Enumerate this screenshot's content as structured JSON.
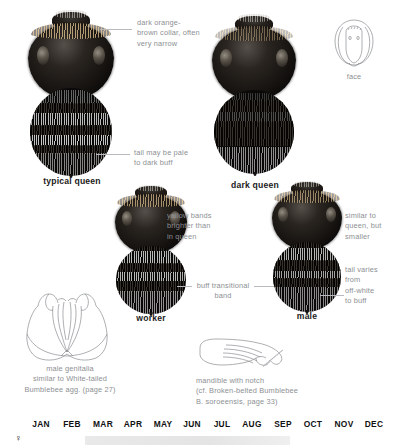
{
  "plate": {
    "species_common": "Buff-tailed Bumblebee",
    "figures": [
      {
        "id": "typical-queen",
        "caption": "typical queen"
      },
      {
        "id": "dark-queen",
        "caption": "dark queen"
      },
      {
        "id": "worker",
        "caption": "worker"
      },
      {
        "id": "male",
        "caption": "male"
      }
    ],
    "annotations": {
      "collar": "dark orange-\nbrown collar, often\nvery narrow",
      "tail": "tail may be pale\nto dark buff",
      "yellow_bands": "yellow bands\nbrighter than\nin queen",
      "buff_band": "buff transitional\nband",
      "male_similar": "similar to\nqueen, but\nsmaller",
      "male_tail": "tail varies\nfrom\noff-white\nto buff"
    },
    "diagrams": [
      {
        "id": "face",
        "label": "face"
      },
      {
        "id": "male-genitalia",
        "label": "male genitalia\nsimilar to White-tailed\nBumblebee agg. (page 27)"
      },
      {
        "id": "mandible",
        "label": "mandible with notch\n(cf. Broken-belted Bumblebee\nB. soroeensis, page 33)"
      }
    ]
  },
  "phenology": {
    "months": [
      "JAN",
      "FEB",
      "MAR",
      "APR",
      "MAY",
      "JUN",
      "JUL",
      "AUG",
      "SEP",
      "OCT",
      "NOV",
      "DEC"
    ],
    "rows": [
      {
        "symbol": "♀",
        "start_month": "FEB",
        "end_month": "SEP"
      }
    ]
  },
  "colors": {
    "annotation_text": "#8d8f93",
    "caption_text": "#1b1b1b",
    "leader_line": "#b9babd",
    "diagram_stroke": "#8a8c8f",
    "phenology_bar": "#e7e7e8",
    "background": "#ffffff"
  }
}
